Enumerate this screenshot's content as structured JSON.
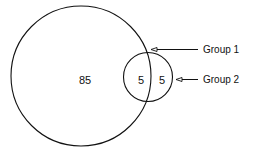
{
  "diagram": {
    "type": "venn",
    "sets": [
      {
        "name": "Group 1",
        "only": 85,
        "label": "Group 1"
      },
      {
        "name": "Group 2",
        "only": 5,
        "label": "Group 2"
      }
    ],
    "intersection": 5,
    "regions": {
      "group1_only": "85",
      "overlap": "5",
      "group2_only": "5"
    },
    "labels": {
      "group1": "Group 1",
      "group2": "Group 2"
    },
    "colors": {
      "stroke": "#111111",
      "background": "#ffffff"
    }
  }
}
